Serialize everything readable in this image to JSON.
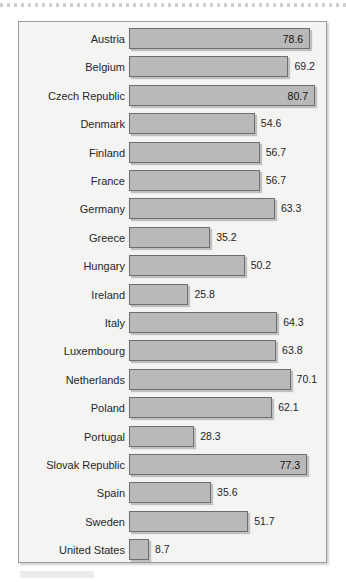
{
  "figure": {
    "panel_background": "#f4f4f3",
    "bar_fill": "#b9b9b9",
    "bar_border": "#6e6e6e",
    "label_color": "#262626"
  },
  "chart_data": {
    "type": "bar",
    "orientation": "horizontal",
    "title": "",
    "subtitle": "",
    "xlabel": "",
    "ylabel": "",
    "grid": false,
    "legend": "none",
    "xlim": [
      0,
      80.7
    ],
    "categories": [
      "Austria",
      "Belgium",
      "Czech Republic",
      "Denmark",
      "Finland",
      "France",
      "Germany",
      "Greece",
      "Hungary",
      "Ireland",
      "Italy",
      "Luxembourg",
      "Netherlands",
      "Poland",
      "Portugal",
      "Slovak Republic",
      "Spain",
      "Sweden",
      "United States"
    ],
    "values": [
      78.6,
      69.2,
      80.7,
      54.6,
      56.7,
      56.7,
      63.3,
      35.2,
      50.2,
      25.8,
      64.3,
      63.8,
      70.1,
      62.1,
      28.3,
      77.3,
      35.6,
      51.7,
      8.7
    ],
    "value_labels": [
      "78.6",
      "69.2",
      "80.7",
      "54.6",
      "56.7",
      "56.7",
      "63.3",
      "35.2",
      "50.2",
      "25.8",
      "64.3",
      "63.8",
      "70.1",
      "62.1",
      "28.3",
      "77.3",
      "35.6",
      "51.7",
      "8.7"
    ],
    "label_inside_bar": [
      true,
      false,
      true,
      false,
      false,
      false,
      false,
      false,
      false,
      false,
      false,
      false,
      false,
      false,
      false,
      true,
      false,
      false,
      false
    ]
  }
}
